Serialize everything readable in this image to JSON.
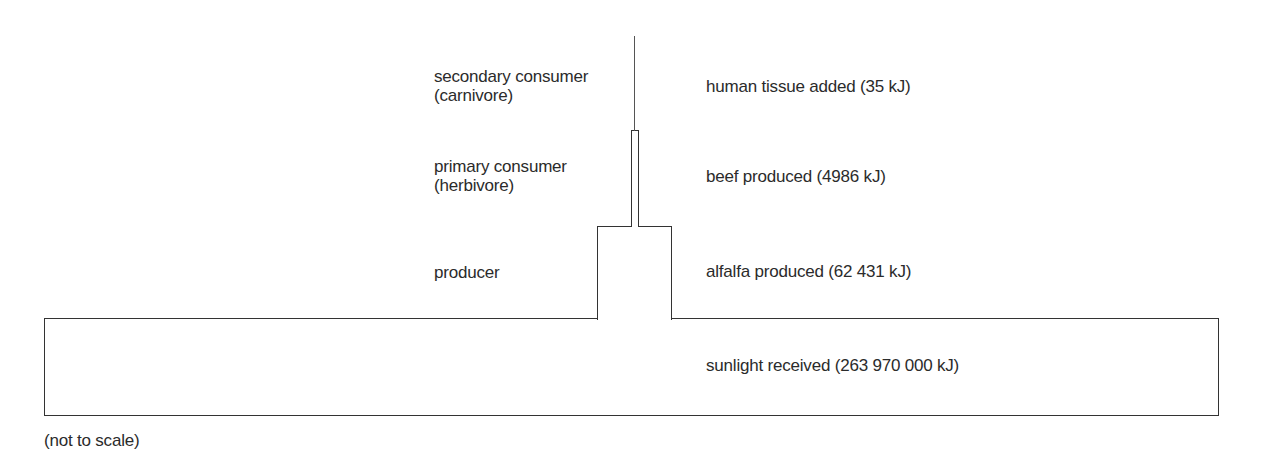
{
  "diagram": {
    "note": "(not to scale)",
    "levels": [
      {
        "name": "secondary consumer",
        "subname": "(carnivore)",
        "description": "human tissue added (35 kJ)",
        "energy_kJ": 35
      },
      {
        "name": "primary consumer",
        "subname": "(herbivore)",
        "description": "beef produced (4986 kJ)",
        "energy_kJ": 4986
      },
      {
        "name": "producer",
        "subname": "",
        "description": "alfalfa produced (62 431 kJ)",
        "energy_kJ": 62431
      },
      {
        "name": "",
        "subname": "",
        "description": "sunlight received (263 970 000 kJ)",
        "energy_kJ": 263970000
      }
    ],
    "colors": {
      "stroke": "#333333",
      "text": "#2b2b2b",
      "background": "#ffffff"
    }
  }
}
